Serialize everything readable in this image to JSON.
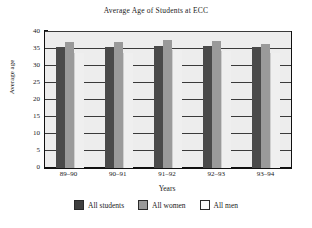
{
  "chart_data": {
    "type": "bar",
    "title": "Average Age of Students at ECC",
    "xlabel": "Years",
    "ylabel": "Average age",
    "categories": [
      "89–90",
      "90–91",
      "91–92",
      "92–93",
      "93–94"
    ],
    "series": [
      {
        "name": "All students",
        "color": "#4a4a4a",
        "values": [
          35.7,
          35.7,
          36.0,
          36.0,
          35.7
        ]
      },
      {
        "name": "All women",
        "color": "#9a9a9a",
        "values": [
          37.0,
          37.1,
          37.6,
          37.5,
          36.6
        ]
      },
      {
        "name": "All men",
        "color": "#efefef",
        "values": [
          33.7,
          33.7,
          34.6,
          34.5,
          33.7
        ]
      }
    ],
    "ylim": [
      0,
      40
    ],
    "yticks": [
      0,
      5,
      10,
      15,
      20,
      25,
      30,
      35,
      40
    ],
    "ytick_labels": [
      "0",
      "5",
      "10",
      "15",
      "20",
      "25",
      "30",
      "35",
      "40"
    ],
    "grid": true,
    "grid_axis": "y",
    "legend_position": "bottom",
    "plot_background": "#ededed"
  }
}
